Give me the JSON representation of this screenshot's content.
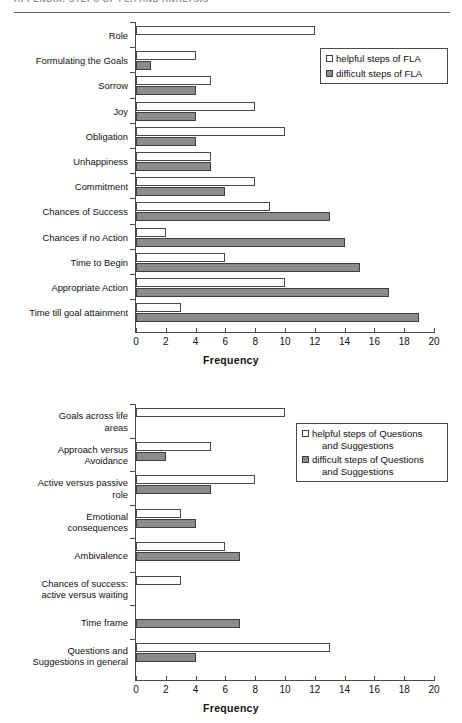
{
  "page": {
    "running_head": "APPENDIX: STEPS OF FLA AND ANALYSIS"
  },
  "colors": {
    "helpful_fill": "#ffffff",
    "difficult_fill": "#8c8c8c",
    "axis": "#4a4a4a",
    "text": "#111111"
  },
  "charts": [
    {
      "id": "chart-fla",
      "legend": {
        "helpful_label_line1": "helpful steps of FLA",
        "helpful_label_line2": "",
        "difficult_label_line1": "difficult steps of FLA",
        "difficult_label_line2": ""
      },
      "xlabel": "Frequency"
    },
    {
      "id": "chart-questions",
      "legend": {
        "helpful_label_line1": "helpful steps of Questions",
        "helpful_label_line2": "and Suggestions",
        "difficult_label_line1": "difficult steps of Questions",
        "difficult_label_line2": "and Suggestions"
      },
      "xlabel": "Frequency"
    }
  ],
  "chart_data": [
    {
      "type": "bar",
      "orientation": "horizontal",
      "title": "",
      "xlabel": "Frequency",
      "ylabel": "",
      "xlim": [
        0,
        20
      ],
      "xticks": [
        0,
        2,
        4,
        6,
        8,
        10,
        12,
        14,
        16,
        18,
        20
      ],
      "grid": false,
      "legend_position": "top-right",
      "categories": [
        "Role",
        "Formulating the Goals",
        "Sorrow",
        "Joy",
        "Obligation",
        "Unhappiness",
        "Commitment",
        "Chances of Success",
        "Chances if no Action",
        "Time to Begin",
        "Appropriate Action",
        "Time till goal attainment"
      ],
      "category_lines": [
        [
          "Role"
        ],
        [
          "Formulating the Goals"
        ],
        [
          "Sorrow"
        ],
        [
          "Joy"
        ],
        [
          "Obligation"
        ],
        [
          "Unhappiness"
        ],
        [
          "Commitment"
        ],
        [
          "Chances of Success"
        ],
        [
          "Chances if no Action"
        ],
        [
          "Time to Begin"
        ],
        [
          "Appropriate Action"
        ],
        [
          "Time till goal attainment"
        ]
      ],
      "series": [
        {
          "name": "helpful steps of FLA",
          "color": "#ffffff",
          "values": [
            12,
            4,
            5,
            8,
            10,
            5,
            8,
            9,
            2,
            6,
            10,
            3
          ]
        },
        {
          "name": "difficult steps of FLA",
          "color": "#8c8c8c",
          "values": [
            0,
            1,
            4,
            4,
            4,
            5,
            6,
            13,
            14,
            15,
            17,
            19
          ]
        }
      ]
    },
    {
      "type": "bar",
      "orientation": "horizontal",
      "title": "",
      "xlabel": "Frequency",
      "ylabel": "",
      "xlim": [
        0,
        20
      ],
      "xticks": [
        0,
        2,
        4,
        6,
        8,
        10,
        12,
        14,
        16,
        18,
        20
      ],
      "grid": false,
      "legend_position": "top-right",
      "categories": [
        "Goals across life areas",
        "Approach versus Avoidance",
        "Active versus passive role",
        "Emotional consequences",
        "Ambivalence",
        "Chances of success: active versus waiting",
        "Time frame",
        "Questions and Suggestions in general"
      ],
      "category_lines": [
        [
          "Goals across life",
          "areas"
        ],
        [
          "Approach versus",
          "Avoidance"
        ],
        [
          "Active versus passive",
          "role"
        ],
        [
          "Emotional",
          "consequences"
        ],
        [
          "Ambivalence"
        ],
        [
          "Chances of success:",
          "active versus waiting"
        ],
        [
          "Time frame"
        ],
        [
          "Questions and",
          "Suggestions in general"
        ]
      ],
      "series": [
        {
          "name": "helpful steps of Questions and Suggestions",
          "color": "#ffffff",
          "values": [
            10,
            5,
            8,
            3,
            6,
            3,
            0,
            13
          ]
        },
        {
          "name": "difficult steps of Questions and Suggestions",
          "color": "#8c8c8c",
          "values": [
            0,
            2,
            5,
            4,
            7,
            0,
            7,
            4
          ]
        }
      ]
    }
  ]
}
